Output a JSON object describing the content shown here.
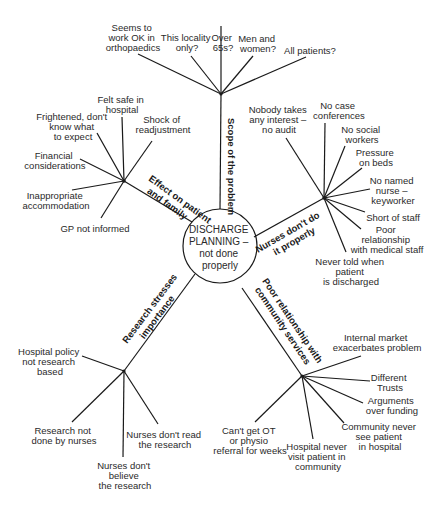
{
  "diagram": {
    "type": "mind-map",
    "center": {
      "lines": [
        "DISCHARGE",
        "PLANNING –",
        "not done",
        "properly"
      ]
    },
    "branches": [
      {
        "id": "scope",
        "label_lines": [
          "Scope of the problem"
        ],
        "leaves": [
          {
            "lines": [
              "Seems to",
              "work OK in",
              "orthopaedics"
            ]
          },
          {
            "lines": [
              "This locality",
              "only?"
            ]
          },
          {
            "lines": [
              "Over",
              "65s?"
            ]
          },
          {
            "lines": [
              "Men and",
              "women?"
            ]
          },
          {
            "lines": [
              "All patients?"
            ]
          }
        ]
      },
      {
        "id": "effect",
        "label_lines": [
          "Effect on patient",
          "and family"
        ],
        "leaves": [
          {
            "lines": [
              "Felt safe in",
              "hospital"
            ]
          },
          {
            "lines": [
              "Frightened, don't",
              "know what",
              "to expect"
            ]
          },
          {
            "lines": [
              "Shock of",
              "readjustment"
            ]
          },
          {
            "lines": [
              "Financial",
              "considerations"
            ]
          },
          {
            "lines": [
              "Inappropriate",
              "accommodation"
            ]
          },
          {
            "lines": [
              "GP not informed"
            ]
          }
        ]
      },
      {
        "id": "nurses",
        "label_lines": [
          "Nurses don't do",
          "it properly"
        ],
        "leaves": [
          {
            "lines": [
              "Nobody takes",
              "any interest –",
              "no audit"
            ]
          },
          {
            "lines": [
              "No case",
              "conferences"
            ]
          },
          {
            "lines": [
              "No social",
              "workers"
            ]
          },
          {
            "lines": [
              "Pressure",
              "on beds"
            ]
          },
          {
            "lines": [
              "No named",
              "nurse –",
              "keyworker"
            ]
          },
          {
            "lines": [
              "Short of staff"
            ]
          },
          {
            "lines": [
              "Poor",
              "relationship",
              "with medical staff"
            ]
          },
          {
            "lines": [
              "Never told when",
              "patient",
              "is discharged"
            ]
          }
        ]
      },
      {
        "id": "research",
        "label_lines": [
          "Research stresses",
          "importance"
        ],
        "leaves": [
          {
            "lines": [
              "Hospital policy",
              "not  research",
              "based"
            ]
          },
          {
            "lines": [
              "Research not",
              "done by nurses"
            ]
          },
          {
            "lines": [
              "Nurses don't",
              "believe",
              "the research"
            ]
          },
          {
            "lines": [
              "Nurses don't read",
              "the research"
            ]
          }
        ]
      },
      {
        "id": "community",
        "label_lines": [
          "Poor relationship with",
          "community services"
        ],
        "leaves": [
          {
            "lines": [
              "Internal market",
              "exacerbates problem"
            ]
          },
          {
            "lines": [
              "Different",
              "Trusts"
            ]
          },
          {
            "lines": [
              "Arguments",
              "over funding"
            ]
          },
          {
            "lines": [
              "Community never",
              "see patient",
              "in hospital"
            ]
          },
          {
            "lines": [
              "Hospital never",
              "visit patient in",
              "community"
            ]
          },
          {
            "lines": [
              "Can't get OT",
              "or physio",
              "referral for weeks"
            ]
          }
        ]
      }
    ]
  }
}
